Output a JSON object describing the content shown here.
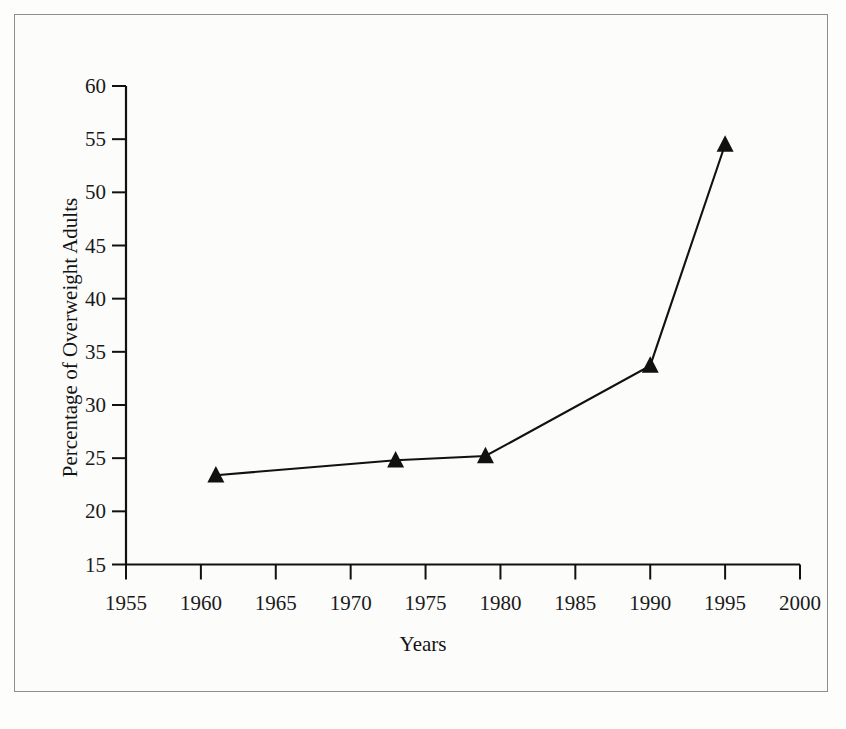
{
  "figure": {
    "background_color": "#fdfdfc",
    "frame_color": "#8e8e8e",
    "ink_color": "#111111"
  },
  "chart_data": {
    "type": "line",
    "title": "",
    "subtitle": "",
    "xlabel": "Years",
    "ylabel": "Percentage of Overweight Adults",
    "xlim": [
      1955,
      2000
    ],
    "ylim": [
      15,
      60
    ],
    "xticks": [
      1955,
      1960,
      1965,
      1970,
      1975,
      1980,
      1985,
      1990,
      1995,
      2000
    ],
    "yticks": [
      15,
      20,
      25,
      30,
      35,
      40,
      45,
      50,
      55,
      60
    ],
    "xtick_labels": [
      "1955",
      "1960",
      "1965",
      "1970",
      "1975",
      "1980",
      "1985",
      "1990",
      "1995",
      "2000"
    ],
    "ytick_labels": [
      "15",
      "20",
      "25",
      "30",
      "35",
      "40",
      "45",
      "50",
      "55",
      "60"
    ],
    "grid": false,
    "legend": null,
    "marker": "filled-triangle-up",
    "marker_color": "#111111",
    "line_color": "#111111",
    "series": [
      {
        "name": "Percentage of Overweight Adults",
        "x": [
          1961,
          1973,
          1979,
          1990,
          1995
        ],
        "values": [
          23.4,
          24.8,
          25.2,
          33.7,
          54.5
        ]
      }
    ]
  },
  "axis_titles": {
    "x": "Years",
    "y": "Percentage of Overweight Adults"
  }
}
